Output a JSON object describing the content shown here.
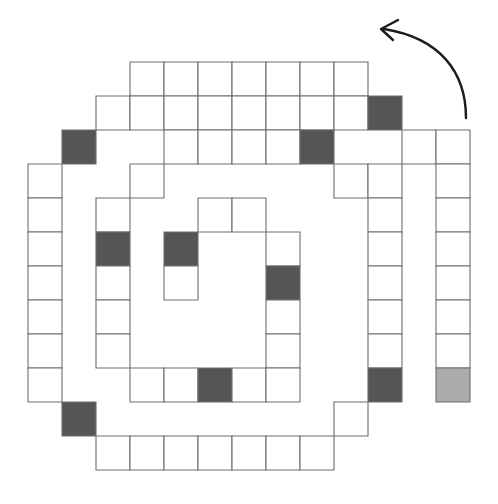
{
  "figure": {
    "title": "Counterclockwise square spiral of cells",
    "background_color": "#ffffff",
    "canvas": {
      "width": 498,
      "height": 504
    },
    "grid": {
      "cell_size": 34,
      "origin_x": 28,
      "origin_y": 62,
      "columns": 13,
      "rows": 12
    },
    "colors": {
      "cell_fill_empty": "#ffffff",
      "cell_fill_dark": "#555555",
      "cell_fill_light": "#ababab",
      "cell_stroke": "#6e6e6e",
      "arrow_stroke": "#1c1c1c"
    },
    "legend_note": "",
    "counts": {
      "total_cells": 84,
      "dark_cells": 10,
      "light_cells": 1,
      "empty_cells": 73
    }
  },
  "arrow": {
    "name": "rotation-direction-arrow",
    "direction": "counterclockwise",
    "path_d": "M 466 118 C 466 72, 440 38, 384 29",
    "head_d": "M 398 20 L 381 29 L 393 40",
    "label": ""
  },
  "cells": [
    {
      "col": 3,
      "row": 0,
      "fill": "empty"
    },
    {
      "col": 4,
      "row": 0,
      "fill": "empty"
    },
    {
      "col": 5,
      "row": 0,
      "fill": "empty"
    },
    {
      "col": 6,
      "row": 0,
      "fill": "empty"
    },
    {
      "col": 7,
      "row": 0,
      "fill": "empty"
    },
    {
      "col": 8,
      "row": 0,
      "fill": "empty"
    },
    {
      "col": 9,
      "row": 0,
      "fill": "empty"
    },
    {
      "col": 2,
      "row": 1,
      "fill": "empty"
    },
    {
      "col": 3,
      "row": 1,
      "fill": "empty"
    },
    {
      "col": 4,
      "row": 1,
      "fill": "empty"
    },
    {
      "col": 5,
      "row": 1,
      "fill": "empty"
    },
    {
      "col": 6,
      "row": 1,
      "fill": "empty"
    },
    {
      "col": 7,
      "row": 1,
      "fill": "empty"
    },
    {
      "col": 8,
      "row": 1,
      "fill": "empty"
    },
    {
      "col": 9,
      "row": 1,
      "fill": "empty"
    },
    {
      "col": 10,
      "row": 1,
      "fill": "dark"
    },
    {
      "col": 1,
      "row": 2,
      "fill": "dark"
    },
    {
      "col": 4,
      "row": 2,
      "fill": "empty"
    },
    {
      "col": 5,
      "row": 2,
      "fill": "empty"
    },
    {
      "col": 6,
      "row": 2,
      "fill": "empty"
    },
    {
      "col": 7,
      "row": 2,
      "fill": "empty"
    },
    {
      "col": 8,
      "row": 2,
      "fill": "dark"
    },
    {
      "col": 11,
      "row": 2,
      "fill": "empty"
    },
    {
      "col": 12,
      "row": 2,
      "fill": "empty"
    },
    {
      "col": 0,
      "row": 3,
      "fill": "empty"
    },
    {
      "col": 3,
      "row": 3,
      "fill": "empty"
    },
    {
      "col": 9,
      "row": 3,
      "fill": "empty"
    },
    {
      "col": 10,
      "row": 3,
      "fill": "empty"
    },
    {
      "col": 12,
      "row": 3,
      "fill": "empty"
    },
    {
      "col": 0,
      "row": 4,
      "fill": "empty"
    },
    {
      "col": 2,
      "row": 4,
      "fill": "empty"
    },
    {
      "col": 5,
      "row": 4,
      "fill": "empty"
    },
    {
      "col": 6,
      "row": 4,
      "fill": "empty"
    },
    {
      "col": 10,
      "row": 4,
      "fill": "empty"
    },
    {
      "col": 12,
      "row": 4,
      "fill": "empty"
    },
    {
      "col": 0,
      "row": 5,
      "fill": "empty"
    },
    {
      "col": 2,
      "row": 5,
      "fill": "dark"
    },
    {
      "col": 4,
      "row": 5,
      "fill": "dark"
    },
    {
      "col": 7,
      "row": 5,
      "fill": "empty"
    },
    {
      "col": 10,
      "row": 5,
      "fill": "empty"
    },
    {
      "col": 12,
      "row": 5,
      "fill": "empty"
    },
    {
      "col": 0,
      "row": 6,
      "fill": "empty"
    },
    {
      "col": 2,
      "row": 6,
      "fill": "empty"
    },
    {
      "col": 4,
      "row": 6,
      "fill": "empty"
    },
    {
      "col": 7,
      "row": 6,
      "fill": "dark"
    },
    {
      "col": 10,
      "row": 6,
      "fill": "empty"
    },
    {
      "col": 12,
      "row": 6,
      "fill": "empty"
    },
    {
      "col": 0,
      "row": 7,
      "fill": "empty"
    },
    {
      "col": 2,
      "row": 7,
      "fill": "empty"
    },
    {
      "col": 7,
      "row": 7,
      "fill": "empty"
    },
    {
      "col": 10,
      "row": 7,
      "fill": "empty"
    },
    {
      "col": 12,
      "row": 7,
      "fill": "empty"
    },
    {
      "col": 0,
      "row": 8,
      "fill": "empty"
    },
    {
      "col": 2,
      "row": 8,
      "fill": "empty"
    },
    {
      "col": 7,
      "row": 8,
      "fill": "empty"
    },
    {
      "col": 10,
      "row": 8,
      "fill": "empty"
    },
    {
      "col": 12,
      "row": 8,
      "fill": "empty"
    },
    {
      "col": 0,
      "row": 9,
      "fill": "empty"
    },
    {
      "col": 3,
      "row": 9,
      "fill": "empty"
    },
    {
      "col": 4,
      "row": 9,
      "fill": "empty"
    },
    {
      "col": 5,
      "row": 9,
      "fill": "dark"
    },
    {
      "col": 6,
      "row": 9,
      "fill": "empty"
    },
    {
      "col": 7,
      "row": 9,
      "fill": "empty"
    },
    {
      "col": 10,
      "row": 9,
      "fill": "dark"
    },
    {
      "col": 12,
      "row": 9,
      "fill": "light"
    },
    {
      "col": 1,
      "row": 10,
      "fill": "dark"
    },
    {
      "col": 9,
      "row": 10,
      "fill": "empty"
    },
    {
      "col": 2,
      "row": 11,
      "fill": "empty"
    },
    {
      "col": 3,
      "row": 11,
      "fill": "empty"
    },
    {
      "col": 4,
      "row": 11,
      "fill": "empty"
    },
    {
      "col": 5,
      "row": 11,
      "fill": "empty"
    },
    {
      "col": 6,
      "row": 11,
      "fill": "empty"
    },
    {
      "col": 7,
      "row": 11,
      "fill": "empty"
    },
    {
      "col": 8,
      "row": 11,
      "fill": "empty"
    }
  ],
  "arms": [
    {
      "name": "arm-outer",
      "segments": [
        {
          "x": 28,
          "y": 164,
          "w": 68,
          "h": 238,
          "orient": "v-left"
        },
        {
          "x": 96,
          "y": 368,
          "w": 272,
          "h": 102,
          "orient": "h-bottom"
        },
        {
          "x": 368,
          "y": 164,
          "w": 102,
          "h": 238,
          "orient": "v-right"
        }
      ]
    }
  ],
  "outline_paths": [
    "M 130 62 H 368 V 96 H 130 Z",
    "M 96 96 H 402 V 130 H 96 Z",
    "M 62 130 H 436 V 164 H 62 Z"
  ]
}
